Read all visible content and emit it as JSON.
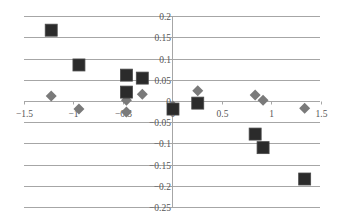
{
  "chart_data": {
    "type": "scatter",
    "title": "",
    "xlabel": "",
    "ylabel": "",
    "xlim": [
      -1.5,
      1.5
    ],
    "ylim": [
      -0.25,
      0.2
    ],
    "grid": {
      "horizontal": true,
      "vertical": false
    },
    "legend": null,
    "x_ticks": [
      -1.5,
      -1,
      -0.5,
      0,
      0.5,
      1,
      1.5
    ],
    "x_tick_labels": [
      "−1.5",
      "−1",
      "−0.5",
      "0",
      "0.5",
      "1",
      "1.5"
    ],
    "y_ticks": [
      0.2,
      0.15,
      0.1,
      0.05,
      0,
      -0.05,
      -0.1,
      -0.15,
      -0.2,
      -0.25
    ],
    "y_tick_labels": [
      "0.2",
      "0.15",
      "0.1",
      "0.05",
      "0",
      "−0.05",
      "−0.1",
      "−0.15",
      "−0.2",
      "−0.25"
    ],
    "series": [
      {
        "name": "Series 1",
        "marker": "diamond",
        "color": "#7a7a7a",
        "points": [
          {
            "x": -1.22,
            "y": 0.012
          },
          {
            "x": -0.94,
            "y": -0.019
          },
          {
            "x": -0.46,
            "y": 0.002
          },
          {
            "x": -0.46,
            "y": -0.026
          },
          {
            "x": -0.3,
            "y": 0.016
          },
          {
            "x": 0.01,
            "y": -0.012
          },
          {
            "x": 0.26,
            "y": 0.024
          },
          {
            "x": 0.84,
            "y": 0.014
          },
          {
            "x": 0.92,
            "y": 0.002
          },
          {
            "x": 1.34,
            "y": -0.017
          }
        ]
      },
      {
        "name": "Series 2",
        "marker": "square",
        "color": "#2b2b2b",
        "points": [
          {
            "x": -1.22,
            "y": 0.167
          },
          {
            "x": -0.94,
            "y": 0.085
          },
          {
            "x": -0.46,
            "y": 0.061
          },
          {
            "x": -0.3,
            "y": 0.054
          },
          {
            "x": -0.46,
            "y": 0.021
          },
          {
            "x": 0.01,
            "y": -0.019
          },
          {
            "x": 0.26,
            "y": -0.005
          },
          {
            "x": 0.84,
            "y": -0.078
          },
          {
            "x": 0.92,
            "y": -0.11
          },
          {
            "x": 1.34,
            "y": -0.184
          }
        ]
      }
    ]
  },
  "layout": {
    "x_origin_px": 172,
    "x_px_per_unit": 99,
    "y_origin_px": 101,
    "y_px_per_unit": 424,
    "grid_left_px": 24,
    "grid_right_px": 320,
    "axis_top_px": 16,
    "axis_bottom_px": 207,
    "gridline_color": "#a6a6a6",
    "axis_color": "#a6a6a6"
  }
}
